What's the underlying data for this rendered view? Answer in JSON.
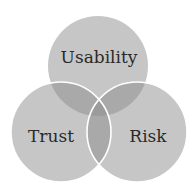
{
  "diagram": {
    "type": "venn",
    "sets": [
      {
        "id": "usability",
        "label": "Usability",
        "cx": 98,
        "cy": 66,
        "r": 50
      },
      {
        "id": "trust",
        "label": "Trust",
        "cx": 61,
        "cy": 132,
        "r": 50
      },
      {
        "id": "risk",
        "label": "Risk",
        "cx": 137,
        "cy": 132,
        "r": 50
      }
    ],
    "colors": {
      "circle_fill": "#c6c6c6",
      "pair_overlap": "#a9a9a9",
      "triple_overlap": "#9b9b9b",
      "outline": "#ffffff",
      "text": "#2a2a2a"
    }
  }
}
